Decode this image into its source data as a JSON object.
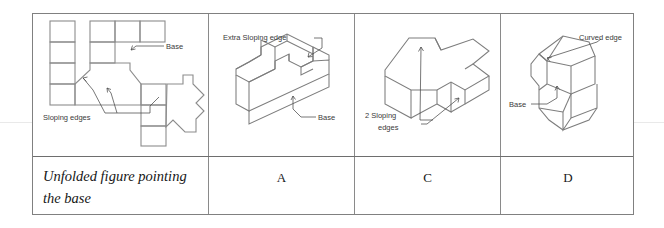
{
  "document": {
    "type": "worksheet-table",
    "background_color": "#ffffff",
    "border_color": "#808080",
    "ink_color": "#8c8c8c",
    "annotation_color": "#3a3a3a"
  },
  "table": {
    "columns": 4,
    "rows": 2,
    "figure_row": {
      "cells": [
        {
          "id": "net",
          "kind": "unfolded-net-drawing",
          "annotations": [
            {
              "id": "base",
              "text": "Base"
            },
            {
              "id": "sloping-edges",
              "text": "Sloping edges"
            }
          ]
        },
        {
          "id": "option-a",
          "kind": "isometric-solid-drawing",
          "annotations": [
            {
              "id": "extra-sloping-edge",
              "text": "Extra Sloping edge"
            },
            {
              "id": "base",
              "text": "Base"
            }
          ]
        },
        {
          "id": "option-c",
          "kind": "isometric-solid-drawing",
          "annotations": [
            {
              "id": "two-sloping-edges-line1",
              "text": "2 Sloping"
            },
            {
              "id": "two-sloping-edges-line2",
              "text": "edges"
            }
          ]
        },
        {
          "id": "option-d",
          "kind": "isometric-solid-drawing",
          "annotations": [
            {
              "id": "curved-edge",
              "text": "Curved edge"
            },
            {
              "id": "base",
              "text": "Base"
            }
          ]
        }
      ]
    },
    "label_row": {
      "cells": [
        {
          "id": "caption",
          "text": "Unfolded figure pointing the base",
          "style": "italic",
          "align": "left"
        },
        {
          "id": "answer-a",
          "text": "A",
          "align": "center"
        },
        {
          "id": "answer-c",
          "text": "C",
          "align": "center"
        },
        {
          "id": "answer-d",
          "text": "D",
          "align": "center"
        }
      ]
    }
  }
}
